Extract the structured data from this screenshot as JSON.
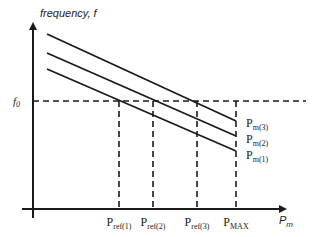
{
  "diagram": {
    "y_axis_label": "frequency, f",
    "x_axis_label_main": "P",
    "x_axis_label_sub": "m",
    "f0_label_main": "f",
    "f0_label_sub": "0",
    "curves": [
      {
        "id": "pm3",
        "label_main": "P",
        "label_sub": "m(3)",
        "x1": 47,
        "y1": 34,
        "x2": 236,
        "y2": 121
      },
      {
        "id": "pm2",
        "label_main": "P",
        "label_sub": "m(2)",
        "x1": 47,
        "y1": 53,
        "x2": 236,
        "y2": 136
      },
      {
        "id": "pm1",
        "label_main": "P",
        "label_sub": "m(1)",
        "x1": 47,
        "y1": 69,
        "x2": 236,
        "y2": 151
      }
    ],
    "ticks": [
      {
        "id": "pref1",
        "label_main": "P",
        "label_sub": "ref(1)",
        "x": 119
      },
      {
        "id": "pref2",
        "label_main": "P",
        "label_sub": "ref(2)",
        "x": 153
      },
      {
        "id": "pref3",
        "label_main": "P",
        "label_sub": "ref(3)",
        "x": 197
      },
      {
        "id": "pmax",
        "label_main": "P",
        "label_sub": "MAX",
        "x": 236
      }
    ],
    "colors": {
      "line": "#1a1a1a",
      "text": "#222222"
    }
  }
}
